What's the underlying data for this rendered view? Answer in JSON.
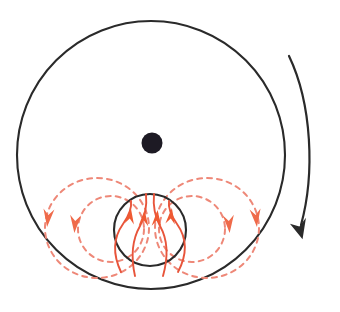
{
  "figure": {
    "kind": "physics-schematic-diagram",
    "background_color": "#ffffff",
    "width": 340,
    "height": 312
  },
  "colors": {
    "outline_black": "#2a2a2a",
    "core_dot_black": "#1d1a24",
    "field_line_solid": "#e8543a",
    "field_loop_dashed": "#ee8878",
    "arrowhead_solid": "#ef5a33",
    "arrowhead_dashed": "#ef6a4a",
    "background": "#ffffff"
  },
  "elements": {
    "outer_body": {
      "name": "outer-body-circle",
      "shape": "circle",
      "cx": 151,
      "cy": 155,
      "r": 134,
      "stroke": "#2a2a2a",
      "stroke_width": 2.1,
      "fill": "none"
    },
    "core_dot": {
      "name": "core-center-dot",
      "shape": "filled-circle",
      "cx": 152,
      "cy": 143,
      "r": 10.5,
      "fill": "#1d1a24"
    },
    "inner_region": {
      "name": "inner-field-region-circle",
      "shape": "circle",
      "cx": 150,
      "cy": 230,
      "r": 36,
      "stroke": "#2a2a2a",
      "stroke_width": 2.1,
      "fill": "none"
    },
    "rotation_arrow": {
      "name": "rotation-direction-arrow",
      "shape": "curved-arrow",
      "start": [
        290,
        56
      ],
      "end": [
        301,
        232
      ],
      "direction": "clockwise",
      "stroke": "#2a2a2a",
      "stroke_width": 2.2
    }
  },
  "field_lines_solid": {
    "count": 4,
    "direction": "upward",
    "stroke": "#e8543a",
    "stroke_width": 1.9,
    "paths": [
      {
        "name": "field-line-1",
        "d": "M 121 272 C 113 255 113 238 123 224 C 130 214 132 208 131 201",
        "arrow_at": [
          130,
          216
        ],
        "arrow_angle": -84
      },
      {
        "name": "field-line-2",
        "d": "M 135 276 C 131 258 132 240 140 226 C 146 215 147 205 146 194",
        "arrow_at": [
          144,
          218
        ],
        "arrow_angle": -86
      },
      {
        "name": "field-line-3",
        "d": "M 163 276 C 168 258 168 240 160 226 C 154 215 153 205 154 194",
        "arrow_at": [
          157,
          218
        ],
        "arrow_angle": -86
      },
      {
        "name": "field-line-4",
        "d": "M 178 272 C 187 255 187 238 177 224 C 170 214 168 208 169 201",
        "arrow_at": [
          171,
          216
        ],
        "arrow_angle": -84
      }
    ]
  },
  "field_loops_dashed": {
    "stroke": "#ee8878",
    "stroke_width": 2.0,
    "dash_pattern": "5 5",
    "loops": [
      {
        "name": "dashed-loop-outer-left",
        "cx": 97,
        "cy": 228,
        "rx": 52,
        "ry": 50,
        "side": "left",
        "flow": "downward-on-outside"
      },
      {
        "name": "dashed-loop-inner-left",
        "cx": 111,
        "cy": 229,
        "rx": 33,
        "ry": 33,
        "side": "left",
        "flow": "downward-on-outside"
      },
      {
        "name": "dashed-loop-inner-right",
        "cx": 192,
        "cy": 229,
        "rx": 33,
        "ry": 33,
        "side": "right",
        "flow": "downward-on-outside"
      },
      {
        "name": "dashed-loop-outer-right",
        "cx": 207,
        "cy": 228,
        "rx": 52,
        "ry": 50,
        "side": "right",
        "flow": "downward-on-outside"
      }
    ]
  },
  "loop_arrowheads": {
    "count": 4,
    "fill": "#ef6a4a",
    "direction": "downward",
    "markers": [
      {
        "name": "loop-arrowhead-outer-left",
        "x": 48,
        "y": 218,
        "angle": 96
      },
      {
        "name": "loop-arrowhead-inner-left",
        "x": 75,
        "y": 224,
        "angle": 94
      },
      {
        "name": "loop-arrowhead-inner-right",
        "x": 229,
        "y": 224,
        "angle": 86
      },
      {
        "name": "loop-arrowhead-outer-right",
        "x": 256,
        "y": 218,
        "angle": 84
      }
    ]
  }
}
